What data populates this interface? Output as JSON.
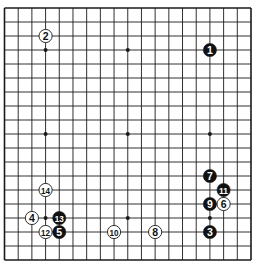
{
  "diagram": {
    "type": "go-board",
    "size": 19,
    "colors": {
      "background": "#ffffff",
      "line": "#1a1a1a",
      "black_stone": "#111111",
      "white_stone": "#ffffff",
      "black_label": "#ffffff",
      "white_label": "#111111"
    },
    "star_points": [
      [
        3,
        3
      ],
      [
        9,
        3
      ],
      [
        15,
        3
      ],
      [
        3,
        9
      ],
      [
        9,
        9
      ],
      [
        15,
        9
      ],
      [
        3,
        15
      ],
      [
        9,
        15
      ],
      [
        15,
        15
      ]
    ],
    "stones": [
      {
        "move": "1",
        "color": "black",
        "col": 15,
        "row": 3
      },
      {
        "move": "2",
        "color": "white",
        "col": 3,
        "row": 2
      },
      {
        "move": "3",
        "color": "black",
        "col": 15,
        "row": 16
      },
      {
        "move": "4",
        "color": "white",
        "col": 2,
        "row": 15
      },
      {
        "move": "5",
        "color": "black",
        "col": 4,
        "row": 16
      },
      {
        "move": "6",
        "color": "white",
        "col": 16,
        "row": 14
      },
      {
        "move": "7",
        "color": "black",
        "col": 15,
        "row": 12
      },
      {
        "move": "8",
        "color": "white",
        "col": 11,
        "row": 16
      },
      {
        "move": "9",
        "color": "black",
        "col": 15,
        "row": 14
      },
      {
        "move": "10",
        "color": "white",
        "col": 8,
        "row": 16
      },
      {
        "move": "11",
        "color": "black",
        "col": 16,
        "row": 13
      },
      {
        "move": "12",
        "color": "white",
        "col": 3,
        "row": 16
      },
      {
        "move": "13",
        "color": "black",
        "col": 4,
        "row": 15
      },
      {
        "move": "14",
        "color": "white",
        "col": 3,
        "row": 13
      }
    ]
  }
}
